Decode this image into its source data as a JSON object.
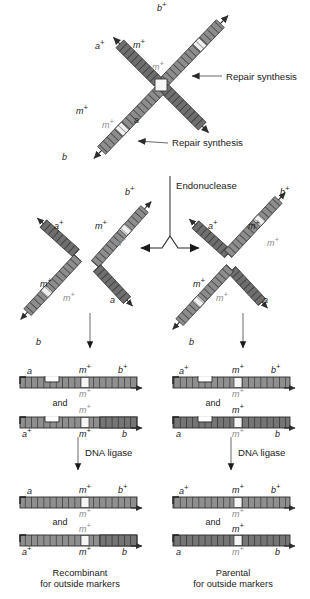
{
  "figure": {
    "background_color": "#ffffff",
    "strand_fill": "#8c8c8c",
    "strand_fill_dark": "#6f6f6f",
    "strand_stroke": "#3a3a3a",
    "heteroduplex_fill": "#f2f2f2",
    "label_color": "#1a1a1a",
    "gray_label_color": "#8e8e8e"
  },
  "process_labels": {
    "repair_synthesis_top": "Repair synthesis",
    "repair_synthesis_bottom": "Repair synthesis",
    "endonuclease": "Endonuclease",
    "dna_ligase_left": "DNA ligase",
    "dna_ligase_right": "DNA ligase"
  },
  "connectors": {
    "and_left_upper": "and",
    "and_right_upper": "and",
    "and_left_lower": "and",
    "and_right_lower": "and"
  },
  "captions": {
    "left": {
      "line1": "Recombinant",
      "line2": "for outside markers"
    },
    "right": {
      "line1": "Parental",
      "line2": "for outside markers"
    }
  },
  "markers": {
    "a": "a",
    "a_plus": "a+",
    "b": "b",
    "b_plus": "b+",
    "m_plus": "m+"
  },
  "panels": {
    "top_holliday": {
      "name": "Holliday junction with repair synthesis",
      "arm_labels": [
        "b+",
        "a+",
        "m+",
        "m+",
        "m+",
        "m+",
        "a",
        "b"
      ]
    },
    "middle_left": {
      "name": "Resolution cut — horizontal isomer",
      "arm_labels": [
        "b+",
        "a+",
        "m+",
        "m+",
        "m+",
        "m+",
        "a",
        "b"
      ]
    },
    "middle_right": {
      "name": "Resolution cut — vertical isomer",
      "arm_labels": [
        "b+",
        "a+",
        "m+",
        "m+",
        "m+",
        "m+",
        "a",
        "b"
      ]
    },
    "duplexes_left_pre": {
      "name": "Left nicked duplex products",
      "top": {
        "left": "a",
        "mid": "m+",
        "right": "b+",
        "under": "m+"
      },
      "bottom": {
        "left": "a+",
        "mid": "m+",
        "right": "b",
        "over": "m+"
      }
    },
    "duplexes_right_pre": {
      "name": "Right nicked duplex products",
      "top": {
        "left": "a+",
        "mid": "m+",
        "right": "b+",
        "under": "m+"
      },
      "bottom": {
        "left": "a",
        "mid": "m+",
        "right": "b",
        "over": "m+"
      }
    },
    "duplexes_left_post": {
      "name": "Left ligated duplex products",
      "top": {
        "left": "a",
        "mid": "m+",
        "right": "b+",
        "under": "m+"
      },
      "bottom": {
        "left": "a+",
        "mid": "m+",
        "right": "b",
        "over": "m+"
      }
    },
    "duplexes_right_post": {
      "name": "Right ligated duplex products",
      "top": {
        "left": "a+",
        "mid": "m+",
        "right": "b+",
        "under": "m+"
      },
      "bottom": {
        "left": "a",
        "mid": "m+",
        "right": "b",
        "over": "m+"
      }
    }
  }
}
